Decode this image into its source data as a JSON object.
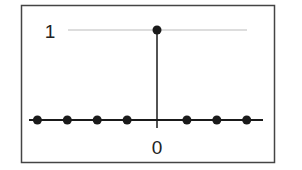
{
  "chart_data": {
    "type": "scatter",
    "style": "stem",
    "title": "",
    "xlabel": "",
    "ylabel": "",
    "x": [
      -4,
      -3,
      -2,
      -1,
      0,
      1,
      2,
      3
    ],
    "values": [
      0,
      0,
      0,
      0,
      1,
      0,
      0,
      0
    ],
    "x_tick_labels": [
      {
        "x": 0,
        "label": "0"
      }
    ],
    "y_tick_labels": [
      {
        "y": 1,
        "label": "1"
      }
    ],
    "ylim": [
      0,
      1
    ],
    "reference_line": {
      "y": 1,
      "style": "thin-gray"
    },
    "grid": false,
    "legend": null,
    "colors": {
      "stem": "#1a1a1a",
      "frame": "#444444",
      "reference": "#bbbbbb"
    }
  },
  "labels": {
    "y_one": "1",
    "x_zero": "0"
  }
}
